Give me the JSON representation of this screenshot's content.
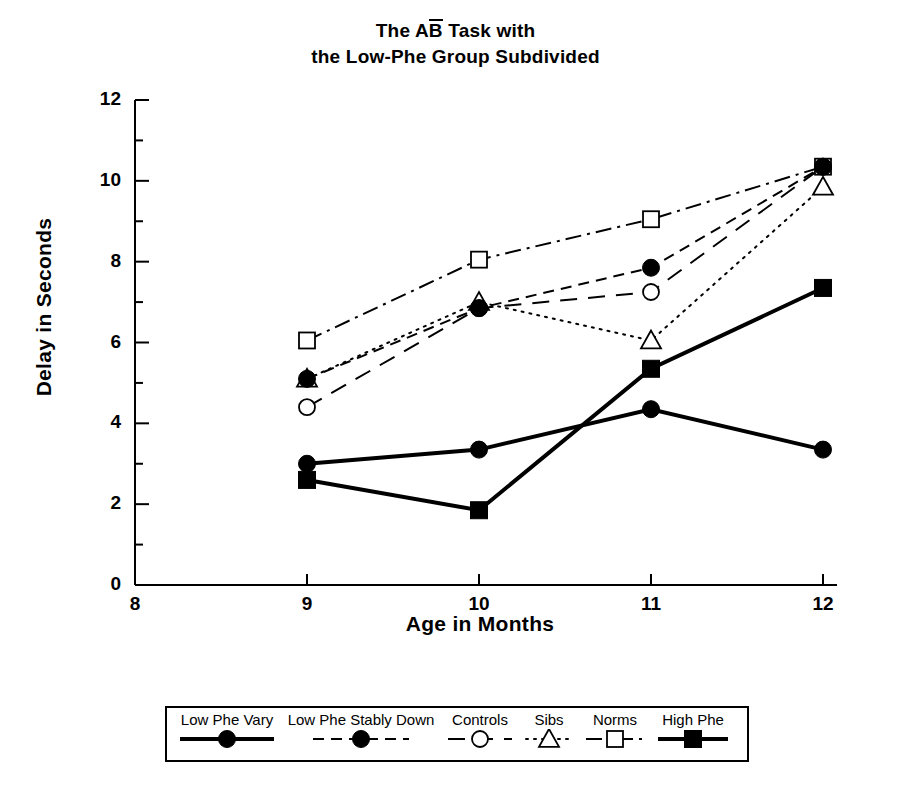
{
  "chart_data": {
    "type": "line",
    "title_line1_pre": "The A",
    "title_line1_bar": "B",
    "title_line1_post": " Task with",
    "title_line2": "the Low-Phe Group Subdivided",
    "xlabel": "Age in Months",
    "ylabel": "Delay in Seconds",
    "x": [
      9,
      10,
      11,
      12
    ],
    "categories": [
      "9",
      "10",
      "11",
      "12"
    ],
    "xlim": [
      8,
      12
    ],
    "ylim": [
      0,
      12
    ],
    "xticks": [
      8,
      9,
      10,
      11,
      12
    ],
    "xtick_labels": [
      "8",
      "9",
      "10",
      "11",
      "12"
    ],
    "yticks": [
      0,
      2,
      4,
      6,
      8,
      10,
      12
    ],
    "ytick_labels": [
      "0",
      "2",
      "4",
      "6",
      "8",
      "10",
      "12"
    ],
    "yminor_ticks": [
      1,
      3,
      5,
      7,
      9,
      11
    ],
    "grid": false,
    "legend_position": "below",
    "series": [
      {
        "name": "Low Phe Vary",
        "marker": "filled-circle",
        "linestyle": "solid",
        "linewidth": 4,
        "values": [
          3.0,
          3.35,
          4.35,
          3.35
        ]
      },
      {
        "name": "Low Phe Stably Down",
        "marker": "filled-circle",
        "linestyle": "dashed",
        "linewidth": 2,
        "values": [
          5.1,
          6.85,
          7.85,
          10.35
        ]
      },
      {
        "name": "Controls",
        "marker": "open-circle",
        "linestyle": "long-dashed",
        "linewidth": 2,
        "values": [
          4.4,
          6.85,
          7.25,
          10.35
        ]
      },
      {
        "name": "Sibs",
        "marker": "open-triangle",
        "linestyle": "dotted",
        "linewidth": 2,
        "values": [
          5.1,
          7.0,
          6.05,
          9.85
        ]
      },
      {
        "name": "Norms",
        "marker": "open-square",
        "linestyle": "dash-dot",
        "linewidth": 2,
        "values": [
          6.05,
          8.05,
          9.05,
          10.35
        ]
      },
      {
        "name": "High Phe",
        "marker": "filled-square",
        "linestyle": "solid",
        "linewidth": 4,
        "values": [
          2.6,
          1.85,
          5.35,
          7.35
        ]
      }
    ]
  },
  "legend": {
    "entries": [
      {
        "label": "Low Phe Vary"
      },
      {
        "label": "Low Phe Stably Down"
      },
      {
        "label": "Controls"
      },
      {
        "label": "Sibs"
      },
      {
        "label": "Norms"
      },
      {
        "label": "High Phe"
      }
    ]
  }
}
